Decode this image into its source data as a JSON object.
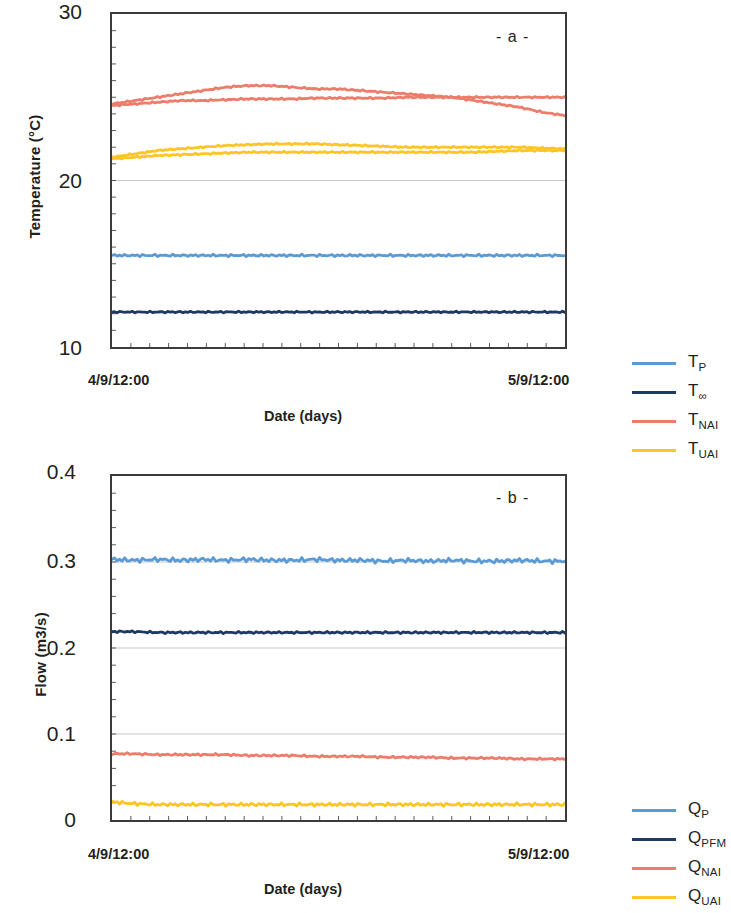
{
  "figure": {
    "panels": [
      {
        "tag": "- a -",
        "ylabel": "Temperature (°C)",
        "xlabel": "Date (days)",
        "yticks": [
          "30",
          "20",
          "10"
        ],
        "xticks": [
          "4/9/12:00",
          "5/9/12:00"
        ],
        "legend": [
          {
            "base": "T",
            "sub": "P",
            "color": "#5B9BD5"
          },
          {
            "base": "T",
            "sub": "∞",
            "color": "#1F3864"
          },
          {
            "base": "T",
            "sub": "NAI",
            "color": "#ED7D6A"
          },
          {
            "base": "T",
            "sub": "UAI",
            "color": "#FFC425"
          }
        ]
      },
      {
        "tag": "- b -",
        "ylabel": "Flow (m3/s)",
        "xlabel": "Date (days)",
        "yticks": [
          "0.4",
          "0.3",
          "0.2",
          "0.1",
          "0"
        ],
        "xticks": [
          "4/9/12:00",
          "5/9/12:00"
        ],
        "legend": [
          {
            "base": "Q",
            "sub": "P",
            "color": "#5B9BD5"
          },
          {
            "base": "Q",
            "sub": "PFM",
            "color": "#1F3864"
          },
          {
            "base": "Q",
            "sub": "NAI",
            "color": "#ED7D6A"
          },
          {
            "base": "Q",
            "sub": "UAI",
            "color": "#FFC425"
          }
        ]
      }
    ]
  },
  "chart_data": [
    {
      "type": "line",
      "title": "- a -",
      "xlabel": "Date (days)",
      "ylabel": "Temperature (°C)",
      "ylim": [
        10,
        30
      ],
      "yticks": [
        10,
        20,
        30
      ],
      "xlim": [
        "4/9/12:00",
        "5/9/12:00"
      ],
      "xticklabels": [
        "4/9/12:00",
        "5/9/12:00"
      ],
      "grid": "horizontal-minor-only",
      "legend_position": "right",
      "x": [
        0,
        0.05,
        0.1,
        0.15,
        0.2,
        0.25,
        0.3,
        0.35,
        0.4,
        0.45,
        0.5,
        0.55,
        0.6,
        0.65,
        0.7,
        0.75,
        0.8,
        0.85,
        0.9,
        0.95,
        1
      ],
      "series": [
        {
          "name": "T_P",
          "label": "TP",
          "color": "#5B9BD5",
          "values": [
            15.5,
            15.5,
            15.5,
            15.5,
            15.5,
            15.5,
            15.5,
            15.5,
            15.5,
            15.5,
            15.5,
            15.5,
            15.5,
            15.5,
            15.5,
            15.5,
            15.5,
            15.5,
            15.5,
            15.5,
            15.5
          ]
        },
        {
          "name": "T_inf",
          "label": "T∞",
          "color": "#1F3864",
          "values": [
            12.1,
            12.1,
            12.1,
            12.1,
            12.1,
            12.1,
            12.1,
            12.1,
            12.1,
            12.1,
            12.1,
            12.1,
            12.1,
            12.1,
            12.1,
            12.1,
            12.1,
            12.1,
            12.1,
            12.1,
            12.1
          ]
        },
        {
          "name": "T_NAI",
          "label": "TNAI",
          "color": "#ED7D6A",
          "values": [
            24.6,
            24.8,
            25.0,
            25.2,
            25.4,
            25.6,
            25.7,
            25.7,
            25.6,
            25.5,
            25.5,
            25.4,
            25.3,
            25.2,
            25.1,
            25.0,
            24.8,
            24.6,
            24.4,
            24.1,
            23.9
          ]
        },
        {
          "name": "T_NAI_2",
          "label": "TNAI",
          "color": "#ED7D6A",
          "values": [
            24.5,
            24.6,
            24.7,
            24.8,
            24.8,
            24.85,
            24.9,
            24.9,
            24.9,
            24.95,
            24.95,
            24.95,
            24.95,
            25.0,
            25.0,
            25.0,
            25.0,
            25.0,
            25.0,
            25.0,
            25.0
          ]
        },
        {
          "name": "T_UAI",
          "label": "TUAI",
          "color": "#FFC425",
          "values": [
            21.4,
            21.6,
            21.8,
            21.9,
            22.0,
            22.1,
            22.15,
            22.2,
            22.2,
            22.2,
            22.15,
            22.1,
            22.05,
            22.0,
            22.0,
            22.0,
            22.0,
            22.0,
            22.0,
            21.95,
            21.9
          ]
        },
        {
          "name": "T_UAI_2",
          "label": "TUAI",
          "color": "#FFC425",
          "values": [
            21.3,
            21.4,
            21.5,
            21.55,
            21.6,
            21.65,
            21.7,
            21.7,
            21.7,
            21.7,
            21.7,
            21.7,
            21.7,
            21.7,
            21.7,
            21.7,
            21.7,
            21.75,
            21.8,
            21.8,
            21.8
          ]
        }
      ]
    },
    {
      "type": "line",
      "title": "- b -",
      "xlabel": "Date (days)",
      "ylabel": "Flow (m3/s)",
      "ylim": [
        0,
        0.4
      ],
      "yticks": [
        0,
        0.1,
        0.2,
        0.3,
        0.4
      ],
      "xlim": [
        "4/9/12:00",
        "5/9/12:00"
      ],
      "xticklabels": [
        "4/9/12:00",
        "5/9/12:00"
      ],
      "grid": "horizontal-minor-only",
      "legend_position": "right",
      "x": [
        0,
        0.05,
        0.1,
        0.15,
        0.2,
        0.25,
        0.3,
        0.35,
        0.4,
        0.45,
        0.5,
        0.55,
        0.6,
        0.65,
        0.7,
        0.75,
        0.8,
        0.85,
        0.9,
        0.95,
        1
      ],
      "series": [
        {
          "name": "Q_P",
          "label": "QP",
          "color": "#5B9BD5",
          "values": [
            0.303,
            0.302,
            0.303,
            0.302,
            0.303,
            0.302,
            0.303,
            0.302,
            0.302,
            0.303,
            0.302,
            0.302,
            0.301,
            0.302,
            0.301,
            0.302,
            0.301,
            0.301,
            0.302,
            0.301,
            0.301
          ]
        },
        {
          "name": "Q_PFM",
          "label": "QPFM",
          "color": "#1F3864",
          "values": [
            0.219,
            0.219,
            0.218,
            0.218,
            0.218,
            0.218,
            0.218,
            0.218,
            0.218,
            0.218,
            0.218,
            0.218,
            0.218,
            0.218,
            0.218,
            0.218,
            0.218,
            0.218,
            0.218,
            0.218,
            0.218
          ]
        },
        {
          "name": "Q_NAI",
          "label": "QNAI",
          "color": "#ED7D6A",
          "values": [
            0.077,
            0.077,
            0.076,
            0.076,
            0.076,
            0.076,
            0.075,
            0.075,
            0.075,
            0.074,
            0.074,
            0.074,
            0.073,
            0.073,
            0.073,
            0.072,
            0.072,
            0.072,
            0.071,
            0.071,
            0.071
          ]
        },
        {
          "name": "Q_UAI",
          "label": "QUAI",
          "color": "#FFC425",
          "values": [
            0.021,
            0.019,
            0.018,
            0.018,
            0.018,
            0.018,
            0.018,
            0.018,
            0.018,
            0.018,
            0.018,
            0.018,
            0.018,
            0.018,
            0.018,
            0.018,
            0.018,
            0.018,
            0.018,
            0.018,
            0.018
          ]
        }
      ]
    }
  ]
}
